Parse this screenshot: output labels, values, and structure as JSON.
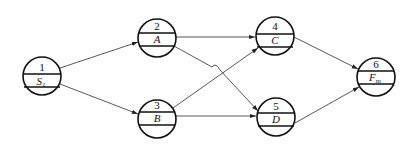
{
  "diagram": {
    "type": "activity-on-node network",
    "nodes": [
      {
        "id": "1",
        "number": "1",
        "label": "S",
        "subscript": "1"
      },
      {
        "id": "2",
        "number": "2",
        "label": "A",
        "subscript": ""
      },
      {
        "id": "3",
        "number": "3",
        "label": "B",
        "subscript": ""
      },
      {
        "id": "4",
        "number": "4",
        "label": "C",
        "subscript": ""
      },
      {
        "id": "5",
        "number": "5",
        "label": "D",
        "subscript": ""
      },
      {
        "id": "6",
        "number": "6",
        "label": "F",
        "subscript": "m"
      }
    ],
    "edges": [
      {
        "from": "1",
        "to": "2"
      },
      {
        "from": "1",
        "to": "3"
      },
      {
        "from": "2",
        "to": "4"
      },
      {
        "from": "2",
        "to": "5",
        "hop_over": "3-4"
      },
      {
        "from": "3",
        "to": "4"
      },
      {
        "from": "3",
        "to": "5"
      },
      {
        "from": "4",
        "to": "6"
      },
      {
        "from": "5",
        "to": "6"
      }
    ]
  }
}
